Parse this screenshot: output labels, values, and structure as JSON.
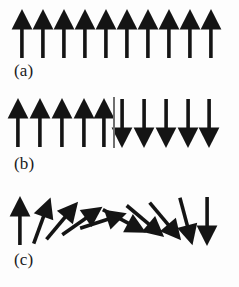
{
  "figure": {
    "background_color": "#fdfdfd",
    "arrow_color": "#141414",
    "wall_color": "#6f6f6f",
    "width": 239,
    "height": 287,
    "caption_font_style": "serif"
  },
  "panels": [
    {
      "id": "panel-a",
      "label": "(a)",
      "description": "uniform ferromagnetic alignment",
      "arrow_count": 10,
      "row_top": 8,
      "label_left": 14,
      "label_top": 62,
      "has_domain_wall": false,
      "arrows": [
        {
          "x": 22,
          "angle": 0
        },
        {
          "x": 43,
          "angle": 0
        },
        {
          "x": 64,
          "angle": 0
        },
        {
          "x": 85,
          "angle": 0
        },
        {
          "x": 106,
          "angle": 0
        },
        {
          "x": 127,
          "angle": 0
        },
        {
          "x": 148,
          "angle": 0
        },
        {
          "x": 169,
          "angle": 0
        },
        {
          "x": 190,
          "angle": 0
        },
        {
          "x": 211,
          "angle": 0
        }
      ]
    },
    {
      "id": "panel-b",
      "label": "(b)",
      "description": "abrupt domain wall between antiparallel domains",
      "arrow_count": 10,
      "row_top": 97,
      "label_left": 14,
      "label_top": 155,
      "has_domain_wall": true,
      "domain_wall": {
        "x": 113,
        "top": 97,
        "height": 51
      },
      "arrows": [
        {
          "x": 18,
          "angle": 0
        },
        {
          "x": 40,
          "angle": 0
        },
        {
          "x": 62,
          "angle": 0
        },
        {
          "x": 84,
          "angle": 0
        },
        {
          "x": 104,
          "angle": 0
        },
        {
          "x": 122,
          "angle": 180
        },
        {
          "x": 144,
          "angle": 180
        },
        {
          "x": 166,
          "angle": 180
        },
        {
          "x": 188,
          "angle": 180
        },
        {
          "x": 209,
          "angle": 180
        }
      ]
    },
    {
      "id": "panel-c",
      "label": "(c)",
      "description": "gradual rotation of spins across an extended domain wall",
      "arrow_count": 10,
      "row_top": 195,
      "label_left": 14,
      "label_top": 251,
      "has_domain_wall": false,
      "arrows": [
        {
          "x": 20,
          "angle": 0
        },
        {
          "x": 42,
          "angle": 20
        },
        {
          "x": 62,
          "angle": 40
        },
        {
          "x": 82,
          "angle": 55
        },
        {
          "x": 103,
          "angle": 72
        },
        {
          "x": 124,
          "angle": 118
        },
        {
          "x": 145,
          "angle": 130
        },
        {
          "x": 165,
          "angle": 140
        },
        {
          "x": 186,
          "angle": 165
        },
        {
          "x": 207,
          "angle": 180
        }
      ]
    }
  ]
}
